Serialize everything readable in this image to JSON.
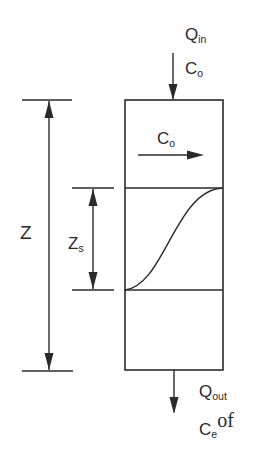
{
  "diagram": {
    "title": "",
    "labels": {
      "q_in": {
        "main": "Q",
        "sub": "in"
      },
      "c_o_top": {
        "main": "C",
        "sub": "o"
      },
      "c_o_inside": {
        "main": "C",
        "sub": "o"
      },
      "z": {
        "main": "Z"
      },
      "z_s": {
        "main": "Z",
        "sub": "s"
      },
      "q_out": {
        "main": "Q",
        "sub": "out"
      },
      "c_e": {
        "main": "C",
        "sub": "e",
        "suffix": "of"
      }
    },
    "colors": {
      "stroke": "#2a2a2a",
      "background": "#ffffff"
    }
  }
}
